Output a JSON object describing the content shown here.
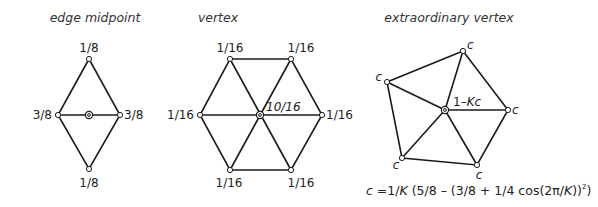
{
  "panels": [
    {
      "title": "edge midpoint",
      "labels": {
        "top": "1/8",
        "left": "3/8",
        "right": "3/8",
        "bottom": "1/8"
      }
    },
    {
      "title": "vertex",
      "labels": {
        "top_left": "1/16",
        "top_right": "1/16",
        "left": "1/16",
        "right": "1/16",
        "bottom_left": "1/16",
        "bottom_right": "1/16",
        "center": "10/16"
      }
    },
    {
      "title": "extraordinary vertex",
      "labels": {
        "top": "c",
        "left": "c",
        "right": "c",
        "bottom_left": "c",
        "bottom_right": "c",
        "center": "1–Kc"
      },
      "formula": {
        "lhs": "c",
        "rhs_prefix": " =1/",
        "K1": "K",
        "rhs_mid": " (5/8 – (3/8 + 1/4 cos(2π/",
        "K2": "K",
        "rhs_end": "))",
        "sup": "2",
        "close": ")"
      }
    }
  ]
}
